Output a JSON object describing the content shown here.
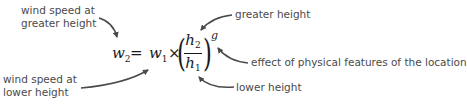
{
  "formula": {
    "lhs_var": "w",
    "lhs_sub": "2",
    "equals": "=",
    "rhs_var": "w",
    "rhs_sub": "1",
    "times": "×",
    "num_var": "h",
    "num_sub": "2",
    "den_var": "h",
    "den_sub": "1",
    "exponent": "g"
  },
  "labels": {
    "w2_line1": "wind speed at",
    "w2_line2": "greater height",
    "w1_line1": "wind speed at",
    "w1_line2": "lower height",
    "h2": "greater height",
    "h1": "lower height",
    "g": "effect of physical features of the location"
  },
  "colors": {
    "label_text": "#4a4a4a",
    "formula_text": "#1a1a1a",
    "arrow": "#4a4a4a"
  }
}
